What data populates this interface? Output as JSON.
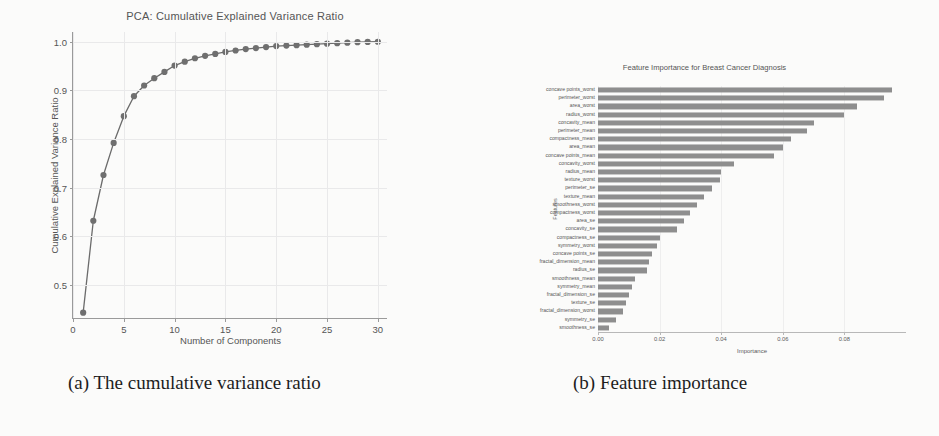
{
  "page": {
    "background_color": "#fbfbfa",
    "text_color": "#4a4a4a"
  },
  "captions": {
    "a": "(a) The cumulative variance ratio",
    "b": "(b) Feature importance"
  },
  "panel_a": {
    "title": "PCA: Cumulative Explained Variance Ratio",
    "xlabel": "Number of Components",
    "ylabel": "Cumulative Explained Variance Ratio",
    "line_color": "#6b6b6b",
    "marker_color": "#6f6f6f",
    "grid_color": "#e9e9ea"
  },
  "panel_b": {
    "title": "Feature Importance for Breast Cancer Diagnosis",
    "xlabel": "Importance",
    "ylabel": "Features",
    "bar_color": "#8e8e8e"
  },
  "chart_data": [
    {
      "type": "line",
      "title": "PCA: Cumulative Explained Variance Ratio",
      "xlabel": "Number of Components",
      "ylabel": "Cumulative Explained Variance Ratio",
      "xlim": [
        0,
        31
      ],
      "ylim": [
        0.43,
        1.02
      ],
      "xticks": [
        0,
        5,
        10,
        15,
        20,
        25,
        30
      ],
      "yticks": [
        0.5,
        0.6,
        0.7,
        0.8,
        0.9,
        1.0
      ],
      "ytick_labels": [
        "0.5",
        "0.6",
        "0.7",
        "0.8",
        "0.9",
        "1.0"
      ],
      "xtick_labels": [
        "0",
        "5",
        "10",
        "15",
        "20",
        "25",
        "30"
      ],
      "grid": true,
      "legend": null,
      "markers": true,
      "x": [
        1,
        2,
        3,
        4,
        5,
        6,
        7,
        8,
        9,
        10,
        11,
        12,
        13,
        14,
        15,
        16,
        17,
        18,
        19,
        20,
        21,
        22,
        23,
        24,
        25,
        26,
        27,
        28,
        29,
        30
      ],
      "y": [
        0.443,
        0.632,
        0.726,
        0.792,
        0.847,
        0.888,
        0.91,
        0.925,
        0.938,
        0.951,
        0.959,
        0.966,
        0.971,
        0.975,
        0.979,
        0.982,
        0.985,
        0.987,
        0.989,
        0.991,
        0.992,
        0.993,
        0.994,
        0.995,
        0.996,
        0.997,
        0.998,
        0.999,
        0.9995,
        1.0
      ]
    },
    {
      "type": "bar",
      "orientation": "horizontal",
      "title": "Feature Importance for Breast Cancer Diagnosis",
      "xlabel": "Importance",
      "ylabel": "Features",
      "xlim": [
        0,
        0.1
      ],
      "xticks": [
        0.0,
        0.02,
        0.04,
        0.06,
        0.08
      ],
      "xtick_labels": [
        "0.00",
        "0.02",
        "0.04",
        "0.06",
        "0.08"
      ],
      "grid": false,
      "legend": null,
      "categories": [
        "concave points_worst",
        "perimeter_worst",
        "area_worst",
        "radius_worst",
        "concavity_mean",
        "perimeter_mean",
        "compactness_mean",
        "area_mean",
        "concave points_mean",
        "concavity_worst",
        "radius_mean",
        "texture_worst",
        "perimeter_se",
        "texture_mean",
        "smoothness_worst",
        "compactness_worst",
        "area_se",
        "concavity_se",
        "compactness_se",
        "symmetry_worst",
        "concave points_se",
        "fractal_dimension_mean",
        "radius_se",
        "smoothness_mean",
        "symmetry_mean",
        "fractal_dimension_se",
        "texture_se",
        "fractal_dimension_worst",
        "symmetry_se",
        "smoothness_se"
      ],
      "values": [
        0.0955,
        0.093,
        0.084,
        0.08,
        0.07,
        0.068,
        0.0625,
        0.06,
        0.057,
        0.044,
        0.04,
        0.0395,
        0.037,
        0.0345,
        0.032,
        0.03,
        0.028,
        0.0255,
        0.02,
        0.019,
        0.0175,
        0.0165,
        0.016,
        0.012,
        0.011,
        0.01,
        0.009,
        0.008,
        0.006,
        0.0035
      ]
    }
  ]
}
